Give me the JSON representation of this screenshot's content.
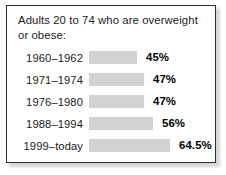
{
  "card": {
    "title_line1": "Adults 20 to 74 who are overweight",
    "title_line2": "or obese:"
  },
  "chart_data": {
    "type": "bar",
    "title": "Adults 20 to 74 who are overweight or obese:",
    "orientation": "horizontal",
    "xlabel": "",
    "ylabel": "",
    "categories": [
      "1960–1962",
      "1971–1974",
      "1976–1980",
      "1988–1994",
      "1999–today"
    ],
    "values": [
      45,
      47,
      47,
      56,
      64.5
    ],
    "value_labels": [
      "45%",
      "47%",
      "47%",
      "56%",
      "64.5%"
    ],
    "units": "percent",
    "grid": false,
    "legend": "none",
    "bar_color": "#d2d2d2",
    "rows": [
      {
        "category": "1960–1962",
        "value": 45,
        "label": "45%",
        "bar_width_px": 48
      },
      {
        "category": "1971–1974",
        "value": 47,
        "label": "47%",
        "bar_width_px": 55
      },
      {
        "category": "1976–1980",
        "value": 47,
        "label": "47%",
        "bar_width_px": 55
      },
      {
        "category": "1988–1994",
        "value": 56,
        "label": "56%",
        "bar_width_px": 64
      },
      {
        "category": "1999–today",
        "value": 64.5,
        "label": "64.5%",
        "bar_width_px": 81
      }
    ]
  }
}
